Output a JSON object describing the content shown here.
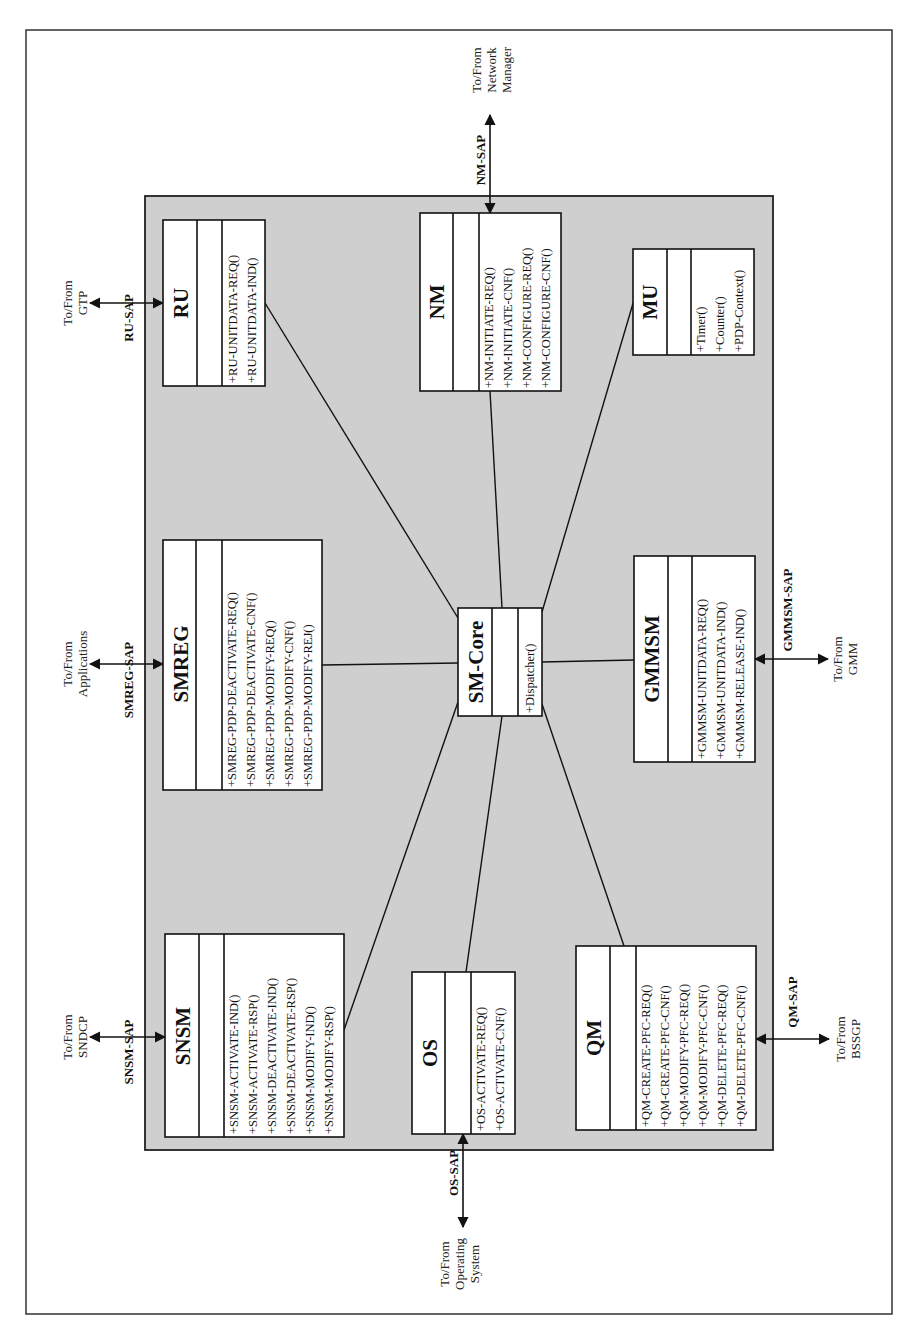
{
  "diagram": {
    "orientation": "rotated-90-ccw",
    "colors": {
      "panel": "#cfcfcf",
      "box": "#ffffff",
      "line": "#111111"
    },
    "classes": {
      "ru": {
        "name": "RU",
        "operations": [
          "+RU-UNITDATA-REQ()",
          "+RU-UNITDATA-IND()"
        ]
      },
      "nm": {
        "name": "NM",
        "operations": [
          "+NM-INITIATE-REQ()",
          "+NM-INITIATE-CNF()",
          "+NM-CONFIGURE-REQ()",
          "+NM-CONFIGURE-CNF()"
        ]
      },
      "mu": {
        "name": "MU",
        "operations": [
          "+Timer()",
          "+Counter()",
          "+PDP-Context()"
        ]
      },
      "smreg": {
        "name": "SMREG",
        "operations": [
          "+SMREG-PDP-DEACTIVATE-REQ()",
          "+SMREG-PDP-DEACTIVATE-CNF()",
          "+SMREG-PDP-MODIFY-REQ()",
          "+SMREG-PDP-MODIFY-CNF()",
          "+SMREG-PDP-MODIFY-REJ()"
        ]
      },
      "smcore": {
        "name": "SM-Core",
        "operations": [
          "+Dispatcher()"
        ]
      },
      "gmmsm": {
        "name": "GMMSM",
        "operations": [
          "+GMMSM-UNITDATA-REQ()",
          "+GMMSM-UNITDATA-IND()",
          "+GMMSM-RELEASE-IND()"
        ]
      },
      "snsm": {
        "name": "SNSM",
        "operations": [
          "+SNSM-ACTIVATE-IND()",
          "+SNSM-ACTIVATE-RSP()",
          "+SNSM-DEACTIVATE-IND()",
          "+SNSM-DEACTIVATE-RSP()",
          "+SNSM-MODIFY-IND()",
          "+SNSM-MODIFY-RSP()"
        ]
      },
      "os": {
        "name": "OS",
        "operations": [
          "+OS-ACTIVATE-REQ()",
          "+OS-ACTIVATE-CNF()"
        ]
      },
      "qm": {
        "name": "QM",
        "operations": [
          "+QM-CREATE-PFC-REQ()",
          "+QM-CREATE-PFC-CNF()",
          "+QM-MODIFY-PFC-REQ()",
          "+QM-MODIFY-PFC-CNF()",
          "+QM-DELETE-PFC-REQ()",
          "+QM-DELETE-PFC-CNF()"
        ]
      }
    },
    "saps": {
      "ru": {
        "label": "RU-SAP",
        "external": [
          "To/From",
          "GTP"
        ]
      },
      "nm": {
        "label": "NM-SAP",
        "external": [
          "To/From",
          "Network",
          "Manager"
        ]
      },
      "smreg": {
        "label": "SMREG-SAP",
        "external": [
          "To/From",
          "Applications"
        ]
      },
      "gmmsm": {
        "label": "GMMSM-SAP",
        "external": [
          "To/From",
          "GMM"
        ]
      },
      "snsm": {
        "label": "SNSM-SAP",
        "external": [
          "To/From",
          "SNDCP"
        ]
      },
      "os": {
        "label": "OS-SAP",
        "external": [
          "To/From",
          "Operating",
          "System"
        ]
      },
      "qm": {
        "label": "QM-SAP",
        "external": [
          "To/From",
          "BSSGP"
        ]
      }
    }
  }
}
